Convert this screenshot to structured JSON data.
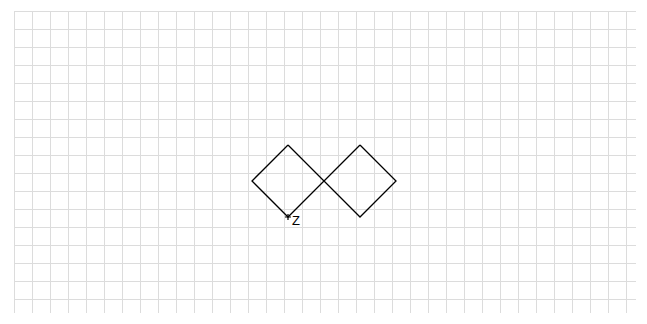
{
  "grid": {
    "x0": 14,
    "y0": 11,
    "x1": 636,
    "y1": 313,
    "cell": 18,
    "color": "#dcdcdc"
  },
  "shape": {
    "stroke": "#000000",
    "paths": [
      [
        [
          288,
          145
        ],
        [
          324,
          181
        ],
        [
          288,
          217
        ],
        [
          252,
          181
        ],
        [
          288,
          145
        ]
      ],
      [
        [
          360,
          145
        ],
        [
          396,
          181
        ],
        [
          360,
          217
        ],
        [
          324,
          181
        ],
        [
          360,
          145
        ]
      ]
    ]
  },
  "point": {
    "x": 288,
    "y": 217,
    "label": "Z"
  }
}
